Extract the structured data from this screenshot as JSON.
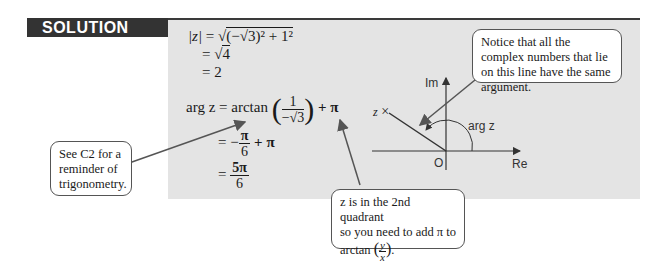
{
  "header": {
    "label": "SOLUTION"
  },
  "modulus": {
    "line1_lhs": "|z|",
    "line1_rhs_prefix": "= √",
    "line1_radicand": "(−√3)² + 1²",
    "line2_prefix": "= √",
    "line2_radicand": "4",
    "line3": "= 2"
  },
  "argument": {
    "line1_lhs": "arg z = arctan",
    "line1_frac_num": "1",
    "line1_frac_den": "−√3",
    "line1_tail": "+ π",
    "line2_prefix": "= −",
    "line2_frac_num": "π",
    "line2_frac_den": "6",
    "line2_tail": "+ π",
    "line3_prefix": "=",
    "line3_frac_num": "5π",
    "line3_frac_den": "6"
  },
  "callouts": {
    "trig": "See C2 for a reminder of trigonometry.",
    "quadrant_line1": "z is in the 2nd quadrant",
    "quadrant_line2": "so you need to add π to",
    "quadrant_line3_prefix": "arctan",
    "quadrant_frac_num": "y",
    "quadrant_frac_den": "x",
    "line_note": "Notice that all the complex numbers that lie on this line have the same argument."
  },
  "diagram": {
    "axis_im": "Im",
    "axis_re": "Re",
    "origin": "O",
    "point_label": "z",
    "point_marker": "×",
    "angle_label": "arg z"
  },
  "colors": {
    "panel": "#e4e4e4",
    "header_bg": "#333333",
    "header_text": "#ffffff",
    "callout_border": "#555555"
  }
}
